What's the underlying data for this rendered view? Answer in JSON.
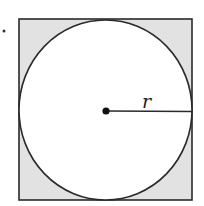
{
  "diagram": {
    "radius_label": "r",
    "colors": {
      "shaded_region": "#e2e2e2",
      "stroke": "#2a2a2a",
      "circle_fill": "#ffffff"
    }
  }
}
